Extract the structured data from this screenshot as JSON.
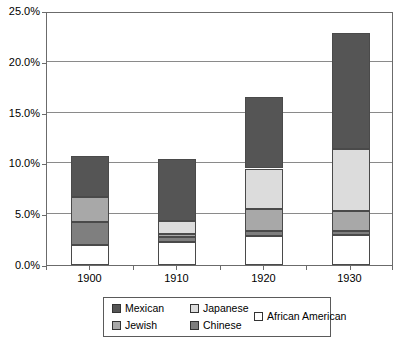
{
  "chart_data": {
    "type": "bar",
    "subtype": "stacked-bar",
    "title": "",
    "xlabel": "",
    "ylabel": "",
    "categories": [
      "1900",
      "1910",
      "1920",
      "1930"
    ],
    "ylim": [
      0,
      25
    ],
    "ytick_values": [
      0,
      5,
      10,
      15,
      20,
      25
    ],
    "ytick_labels": [
      "0.0%",
      "5.0%",
      "10.0%",
      "15.0%",
      "20.0%",
      "25.0%"
    ],
    "grid": true,
    "units": "percent",
    "stack_order_bottom_to_top": [
      "African American",
      "Chinese",
      "Jewish",
      "Japanese",
      "Mexican"
    ],
    "legend": {
      "position": "bottom",
      "entries": [
        {
          "label": "Mexican",
          "color": "#555555"
        },
        {
          "label": "Japanese",
          "color": "#dcdcdc"
        },
        {
          "label": "Jewish",
          "color": "#a8a8a8"
        },
        {
          "label": "Chinese",
          "color": "#7f7f7f"
        },
        {
          "label": "African American",
          "color": "#ffffff"
        }
      ]
    },
    "series": [
      {
        "name": "African American",
        "color": "#ffffff",
        "values": [
          2.0,
          2.3,
          2.9,
          3.0
        ]
      },
      {
        "name": "Chinese",
        "color": "#7f7f7f",
        "values": [
          2.2,
          0.5,
          0.4,
          0.3
        ]
      },
      {
        "name": "Jewish",
        "color": "#a8a8a8",
        "values": [
          2.5,
          0.3,
          2.2,
          2.0
        ]
      },
      {
        "name": "Japanese",
        "color": "#dcdcdc",
        "values": [
          0.0,
          1.2,
          4.0,
          6.1
        ]
      },
      {
        "name": "Mexican",
        "color": "#555555",
        "values": [
          4.0,
          6.1,
          7.0,
          11.4
        ]
      }
    ],
    "totals": [
      10.7,
      10.4,
      16.5,
      22.8
    ]
  }
}
